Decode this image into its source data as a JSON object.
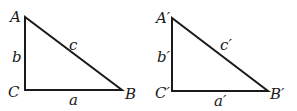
{
  "figure": {
    "triangles": [
      {
        "id": "ABC",
        "vertices": {
          "A": "A",
          "B": "B",
          "C": "C"
        },
        "sides": {
          "a": "a",
          "b": "b",
          "c": "c"
        }
      },
      {
        "id": "A'B'C'",
        "vertices": {
          "A": "A′",
          "B": "B′",
          "C": "C′"
        },
        "sides": {
          "a": "a′",
          "b": "b′",
          "c": "c′"
        }
      }
    ]
  }
}
